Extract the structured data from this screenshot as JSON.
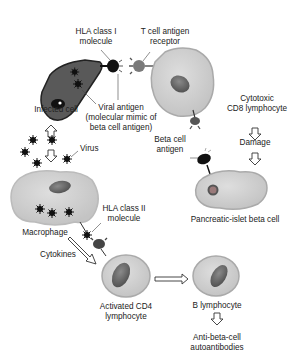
{
  "labels": {
    "hla_class1": [
      "HLA class I",
      "molecule"
    ],
    "tcr": [
      "T cell antigen",
      "receptor"
    ],
    "infected_cell": "Infected cell",
    "viral_antigen": [
      "Viral antigen",
      "(molecular mimic of",
      "beta cell antigen)"
    ],
    "virus": "Virus",
    "cytotoxic": [
      "Cytotoxic",
      "CD8 lymphocyte"
    ],
    "damage": "Damage",
    "beta_cell_antigen": [
      "Beta cell",
      "antigen"
    ],
    "pancreatic": "Pancreatic-islet beta cell",
    "macrophage": "Macrophage",
    "hla_class2": [
      "HLA class II",
      "molecule"
    ],
    "cytokines": "Cytokines",
    "activated_cd4": [
      "Activated CD4",
      "lymphocyte"
    ],
    "b_lymphocyte": "B lymphocyte",
    "autoantibodies": [
      "Anti-beta-cell",
      "autoantibodies"
    ]
  },
  "colors": {
    "cell_fill": "#d2d2d2",
    "cell_edge": "#a9a9a9",
    "infected_fill": "#5a5a5a",
    "nucleus": "#6e6e6e",
    "dark": "#111111",
    "text": "#222222"
  }
}
